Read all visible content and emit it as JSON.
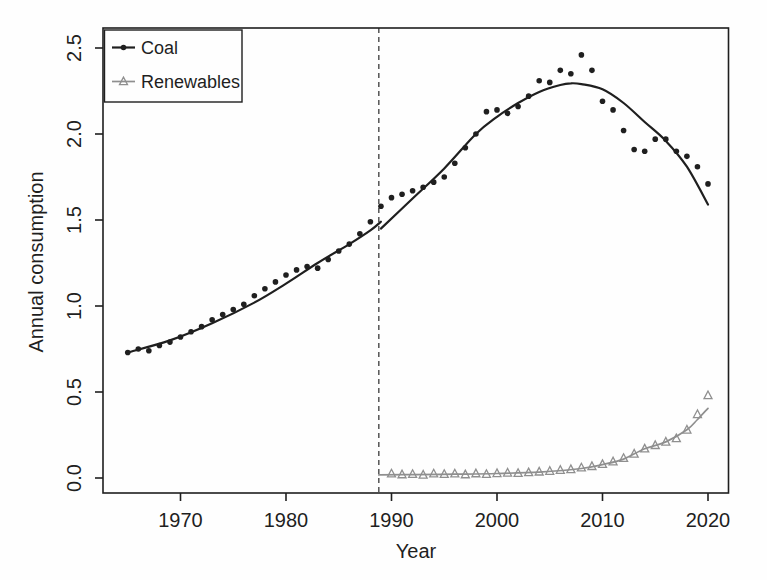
{
  "figure": {
    "background": "#fefefe",
    "ink_color": "#1f1f1f",
    "gray_color": "#8f8f8f"
  },
  "chart_data": {
    "type": "scatter",
    "title": "",
    "xlabel": "Year",
    "ylabel": "Annual consumption",
    "grid": false,
    "xlim": [
      1962.8,
      2022.1
    ],
    "ylim": [
      -0.09,
      2.62
    ],
    "x_ticks": [
      {
        "value": 1970,
        "label": "1970"
      },
      {
        "value": 1980,
        "label": "1980"
      },
      {
        "value": 1990,
        "label": "1990"
      },
      {
        "value": 2000,
        "label": "2000"
      },
      {
        "value": 2010,
        "label": "2010"
      },
      {
        "value": 2020,
        "label": "2020"
      }
    ],
    "y_ticks": [
      {
        "value": 0.0,
        "label": "0.0"
      },
      {
        "value": 0.5,
        "label": "0.5"
      },
      {
        "value": 1.0,
        "label": "1.0"
      },
      {
        "value": 1.5,
        "label": "1.5"
      },
      {
        "value": 2.0,
        "label": "2.0"
      },
      {
        "value": 2.5,
        "label": "2.5"
      }
    ],
    "break_line": {
      "year": 1988.8,
      "style": "dashed",
      "color": "#2a2a2a"
    },
    "legend": {
      "position": "top-left",
      "entries": [
        {
          "label": "Coal",
          "marker": "filled-circle",
          "color": "#1f1f1f"
        },
        {
          "label": "Renewables",
          "marker": "open-triangle",
          "color": "#8f8f8f"
        }
      ]
    },
    "series": [
      {
        "name": "Coal",
        "marker": "filled-circle",
        "color": "#1f1f1f",
        "years": [
          1965,
          1966,
          1967,
          1968,
          1969,
          1970,
          1971,
          1972,
          1973,
          1974,
          1975,
          1976,
          1977,
          1978,
          1979,
          1980,
          1981,
          1982,
          1983,
          1984,
          1985,
          1986,
          1987,
          1988,
          1989,
          1990,
          1991,
          1992,
          1993,
          1994,
          1995,
          1996,
          1997,
          1998,
          1999,
          2000,
          2001,
          2002,
          2003,
          2004,
          2005,
          2006,
          2007,
          2008,
          2009,
          2010,
          2011,
          2012,
          2013,
          2014,
          2015,
          2016,
          2017,
          2018,
          2019,
          2020
        ],
        "values": [
          0.73,
          0.75,
          0.74,
          0.77,
          0.79,
          0.82,
          0.85,
          0.88,
          0.92,
          0.95,
          0.98,
          1.01,
          1.06,
          1.1,
          1.14,
          1.18,
          1.21,
          1.23,
          1.22,
          1.27,
          1.32,
          1.36,
          1.42,
          1.49,
          1.58,
          1.63,
          1.65,
          1.67,
          1.69,
          1.72,
          1.75,
          1.83,
          1.92,
          2.0,
          2.13,
          2.14,
          2.12,
          2.16,
          2.22,
          2.31,
          2.3,
          2.37,
          2.35,
          2.46,
          2.37,
          2.19,
          2.14,
          2.02,
          1.91,
          1.9,
          1.97,
          1.97,
          1.9,
          1.87,
          1.81,
          1.71
        ],
        "fit_curves": [
          {
            "points": [
              [
                1965,
                0.73
              ],
              [
                1969,
                0.8
              ],
              [
                1973,
                0.9
              ],
              [
                1977,
                1.02
              ],
              [
                1980,
                1.13
              ],
              [
                1983,
                1.25
              ],
              [
                1986,
                1.36
              ],
              [
                1988,
                1.44
              ],
              [
                1989,
                1.49
              ]
            ]
          },
          {
            "points": [
              [
                1989,
                1.45
              ],
              [
                1992,
                1.625
              ],
              [
                1995,
                1.8
              ],
              [
                1998,
                2.0
              ],
              [
                2000,
                2.1
              ],
              [
                2002,
                2.18
              ],
              [
                2004,
                2.245
              ],
              [
                2006,
                2.285
              ],
              [
                2007,
                2.295
              ],
              [
                2008,
                2.29
              ],
              [
                2010,
                2.26
              ],
              [
                2012,
                2.18
              ],
              [
                2014,
                2.07
              ],
              [
                2016,
                1.96
              ],
              [
                2018,
                1.81
              ],
              [
                2020,
                1.59
              ]
            ]
          }
        ]
      },
      {
        "name": "Renewables",
        "marker": "open-triangle",
        "color": "#8f8f8f",
        "years": [
          1990,
          1991,
          1992,
          1993,
          1994,
          1995,
          1996,
          1997,
          1998,
          1999,
          2000,
          2001,
          2002,
          2003,
          2004,
          2005,
          2006,
          2007,
          2008,
          2009,
          2010,
          2011,
          2012,
          2013,
          2014,
          2015,
          2016,
          2017,
          2018,
          2019,
          2020
        ],
        "values": [
          0.025,
          0.02,
          0.022,
          0.018,
          0.025,
          0.022,
          0.025,
          0.02,
          0.026,
          0.022,
          0.027,
          0.03,
          0.028,
          0.032,
          0.036,
          0.04,
          0.046,
          0.05,
          0.06,
          0.068,
          0.08,
          0.095,
          0.115,
          0.14,
          0.17,
          0.19,
          0.21,
          0.23,
          0.28,
          0.37,
          0.48
        ],
        "fit_curves": [
          {
            "points": [
              [
                1988.8,
                0.018
              ],
              [
                1992,
                0.02
              ],
              [
                1996,
                0.022
              ],
              [
                2000,
                0.026
              ],
              [
                2004,
                0.034
              ],
              [
                2008,
                0.055
              ],
              [
                2010,
                0.078
              ],
              [
                2012,
                0.11
              ],
              [
                2014,
                0.17
              ],
              [
                2016,
                0.21
              ],
              [
                2018,
                0.28
              ],
              [
                2019,
                0.34
              ],
              [
                2020,
                0.405
              ]
            ]
          }
        ]
      }
    ]
  }
}
